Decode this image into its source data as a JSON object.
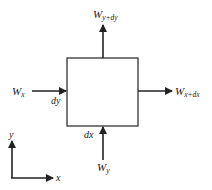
{
  "diagram": {
    "type": "control-volume-flux",
    "element_box": {
      "x": 67,
      "y": 58,
      "w": 71,
      "h": 68
    },
    "labels": {
      "w_x": {
        "main": "W",
        "sub": "x"
      },
      "w_x_dx": {
        "main": "W",
        "sub": "x+dx"
      },
      "w_y": {
        "main": "W",
        "sub": "y"
      },
      "w_y_dy": {
        "main": "W",
        "sub": "y+dy"
      },
      "dy": "dy",
      "dx": "dx",
      "axis_x": "x",
      "axis_y": "y"
    },
    "colors": {
      "stroke": "#222222",
      "background": "#ffffff"
    }
  }
}
